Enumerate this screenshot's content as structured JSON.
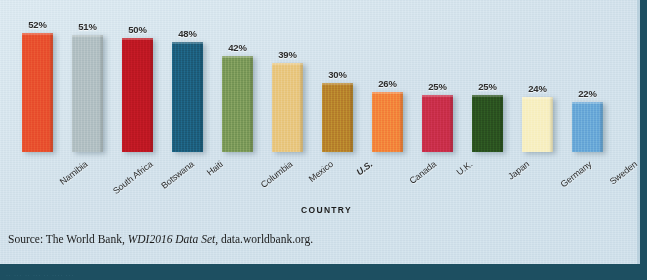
{
  "chart_data": {
    "type": "bar",
    "title": "",
    "subtitle": "",
    "xlabel": "COUNTRY",
    "ylabel": "",
    "ylim": [
      0,
      57
    ],
    "grid": false,
    "legend": null,
    "value_suffix": "%",
    "categories": [
      "Namibia",
      "South Africa",
      "Botswana",
      "Haiti",
      "Columbia",
      "Mexico",
      "U.S.",
      "Canada",
      "U.K.",
      "Japan",
      "Germany",
      "Sweden"
    ],
    "values": [
      52,
      51,
      50,
      48,
      42,
      39,
      30,
      26,
      25,
      25,
      24,
      22
    ],
    "value_labels": [
      "52%",
      "51%",
      "50%",
      "48%",
      "42%",
      "39%",
      "30%",
      "26%",
      "25%",
      "25%",
      "24%",
      "22%"
    ],
    "bar_colors": [
      "#e8512f",
      "#b2c0c3",
      "#bf1823",
      "#1d5f7e",
      "#7c9a5a",
      "#e8c781",
      "#b8842c",
      "#f3853c",
      "#ca2f4a",
      "#2b5320",
      "#f7efc2",
      "#6aa9d8"
    ],
    "highlighted_category": "U.S.",
    "bars": [
      {
        "category": "Namibia",
        "value": 52,
        "label": "52%",
        "color": "#e8512f",
        "emphasis": false
      },
      {
        "category": "South Africa",
        "value": 51,
        "label": "51%",
        "color": "#b2c0c3",
        "emphasis": false
      },
      {
        "category": "Botswana",
        "value": 50,
        "label": "50%",
        "color": "#bf1823",
        "emphasis": false
      },
      {
        "category": "Haiti",
        "value": 48,
        "label": "48%",
        "color": "#1d5f7e",
        "emphasis": false
      },
      {
        "category": "Columbia",
        "value": 42,
        "label": "42%",
        "color": "#7c9a5a",
        "emphasis": false
      },
      {
        "category": "Mexico",
        "value": 39,
        "label": "39%",
        "color": "#e8c781",
        "emphasis": false
      },
      {
        "category": "U.S.",
        "value": 30,
        "label": "30%",
        "color": "#b8842c",
        "emphasis": true
      },
      {
        "category": "Canada",
        "value": 26,
        "label": "26%",
        "color": "#f3853c",
        "emphasis": false
      },
      {
        "category": "U.K.",
        "value": 25,
        "label": "25%",
        "color": "#ca2f4a",
        "emphasis": false
      },
      {
        "category": "Japan",
        "value": 25,
        "label": "25%",
        "color": "#2b5320",
        "emphasis": false
      },
      {
        "category": "Germany",
        "value": 24,
        "label": "24%",
        "color": "#f7efc2",
        "emphasis": false
      },
      {
        "category": "Sweden",
        "value": 22,
        "label": "22%",
        "color": "#6aa9d8",
        "emphasis": false
      }
    ]
  },
  "source": {
    "prefix": "Source: The World Bank, ",
    "italic": "WDI2016 Data Set",
    "suffix": ", data.worldbank.org."
  },
  "figure": {
    "background_color": "#d3e3ed",
    "border_color": "#1d4f61",
    "bottom_band_text": "·· ··· ·· ··· ·· ···· ···"
  }
}
